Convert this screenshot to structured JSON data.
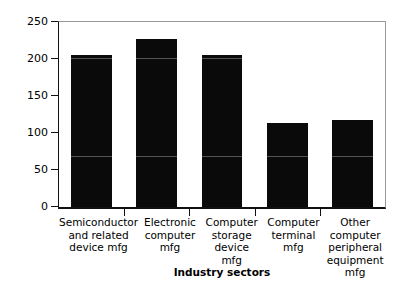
{
  "chart_data": {
    "type": "bar",
    "title": "",
    "subtitle": "",
    "xlabel": "Industry sectors",
    "ylabel": "$ thousands",
    "categories": [
      "Semiconductor and related device mfg",
      "Electronic computer mfg",
      "Computer storage device mfg",
      "Computer terminal mfg",
      "Other computer peripheral equipment mfg"
    ],
    "category_lines": [
      [
        "Semiconductor",
        "and related",
        "device mfg"
      ],
      [
        "Electronic",
        "computer",
        "mfg"
      ],
      [
        "Computer",
        "storage",
        "device",
        "mfg"
      ],
      [
        "Computer",
        "terminal",
        "mfg"
      ],
      [
        "Other",
        "computer",
        "peripheral",
        "equipment mfg"
      ]
    ],
    "values": [
      205,
      227,
      206,
      113,
      118
    ],
    "ylim": [
      0,
      250
    ],
    "ytick_values": [
      0,
      50,
      100,
      150,
      200,
      250
    ],
    "ytick_labels": [
      "0",
      "50",
      "100",
      "150",
      "200",
      "250"
    ],
    "grid": false,
    "legend": null,
    "bar_color": "#0a0a0a",
    "background_color": "#ffffff",
    "axis_color": "#111111"
  }
}
